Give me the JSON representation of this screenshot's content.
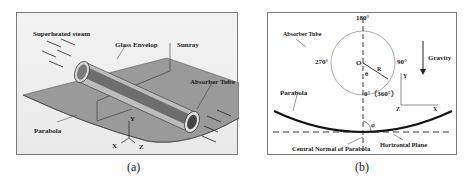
{
  "figure": {
    "panel_a": {
      "caption": "(a)",
      "labels": {
        "steam": "Superheated steam",
        "glass": "Glass Envelop",
        "sunray": "Sunray",
        "absorber": "Absorber Tube",
        "parabola": "Parabola",
        "axis_y": "Y",
        "axis_x": "X",
        "axis_z": "Z"
      }
    },
    "panel_b": {
      "caption": "(b)",
      "labels": {
        "deg180": "180°",
        "absorber": "Absorber Tube",
        "deg270": "270°",
        "origin": "O",
        "radius": "R",
        "theta": "θ",
        "deg90": "90°",
        "deg0": "0°（360°）",
        "gravity": "Gravity",
        "axis_y": "Y",
        "axis_x": "X",
        "axis_z": "Z",
        "parabola": "Parabola",
        "phi": "φ",
        "central_normal": "Central Normal of Parabola",
        "horizontal": "Horizontal Plane"
      }
    }
  }
}
